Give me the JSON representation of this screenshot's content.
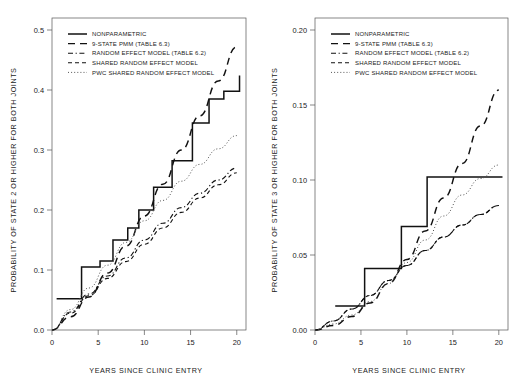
{
  "figure": {
    "background": "#ffffff",
    "ink_color": "#111111",
    "panel_count": 2
  },
  "chart_data": [
    {
      "type": "line",
      "panel": "left",
      "title": "",
      "xlabel": "YEARS SINCE CLINIC ENTRY",
      "ylabel": "PROBABILITY OF STATE 2 OR HIGHER FOR BOTH JOINTS",
      "xlim": [
        0,
        21
      ],
      "ylim": [
        0.0,
        0.52
      ],
      "xticks": [
        0,
        5,
        10,
        15,
        20
      ],
      "xticklabels": [
        "0",
        "5",
        "10",
        "15",
        "20"
      ],
      "yticks": [
        0.0,
        0.1,
        0.2,
        0.3,
        0.4,
        0.5
      ],
      "yticklabels": [
        "0.0",
        "0.1",
        "0.2",
        "0.3",
        "0.4",
        "0.5"
      ],
      "grid": false,
      "legend_position": "top-left",
      "series": [
        {
          "name": "NONPARAMETRIC",
          "style": "solid-step",
          "step_x": [
            0.5,
            2.0,
            3.2,
            5.2,
            6.6,
            8.2,
            9.4,
            11.0,
            13.0,
            15.2,
            17.0,
            18.6,
            20.3
          ],
          "step_y": [
            0.052,
            0.052,
            0.105,
            0.115,
            0.15,
            0.17,
            0.2,
            0.238,
            0.282,
            0.345,
            0.385,
            0.398,
            0.424
          ]
        },
        {
          "name": "9-STATE PMM (TABLE 6.3)",
          "style": "long-dash",
          "x": [
            0,
            2,
            4,
            6,
            8,
            10,
            12,
            14,
            16,
            18,
            20
          ],
          "y": [
            0.0,
            0.022,
            0.055,
            0.095,
            0.14,
            0.19,
            0.243,
            0.3,
            0.357,
            0.415,
            0.472
          ]
        },
        {
          "name": "RANDOM EFFECT MODEL (TABLE 6.2)",
          "style": "dash-dot",
          "x": [
            0,
            2,
            4,
            6,
            8,
            10,
            12,
            14,
            16,
            18,
            20
          ],
          "y": [
            0.0,
            0.03,
            0.06,
            0.09,
            0.12,
            0.15,
            0.178,
            0.204,
            0.228,
            0.25,
            0.27
          ]
        },
        {
          "name": "SHARED RANDOM EFFECT MODEL",
          "style": "dash",
          "x": [
            0,
            2,
            4,
            6,
            8,
            10,
            12,
            14,
            16,
            18,
            20
          ],
          "y": [
            0.0,
            0.028,
            0.057,
            0.086,
            0.114,
            0.143,
            0.17,
            0.196,
            0.22,
            0.242,
            0.262
          ]
        },
        {
          "name": "PWC SHARED RANDOM EFFECT MODEL",
          "style": "dotted",
          "x": [
            0,
            2,
            4,
            6,
            8,
            10,
            12,
            14,
            16,
            18,
            20
          ],
          "y": [
            0.0,
            0.034,
            0.07,
            0.108,
            0.146,
            0.182,
            0.216,
            0.248,
            0.276,
            0.302,
            0.324
          ]
        }
      ]
    },
    {
      "type": "line",
      "panel": "right",
      "title": "",
      "xlabel": "YEARS SINCE CLINIC ENTRY",
      "ylabel": "PROBABILITY OF STATE 3 OR HIGHER FOR BOTH JOINTS",
      "xlim": [
        0,
        21
      ],
      "ylim": [
        0.0,
        0.208
      ],
      "xticks": [
        0,
        5,
        10,
        15,
        20
      ],
      "xticklabels": [
        "0",
        "5",
        "10",
        "15",
        "20"
      ],
      "yticks": [
        0.0,
        0.05,
        0.1,
        0.15,
        0.2
      ],
      "yticklabels": [
        "0.00",
        "0.05",
        "0.10",
        "0.15",
        "0.20"
      ],
      "grid": false,
      "legend_position": "top-left",
      "series": [
        {
          "name": "NONPARAMETRIC",
          "style": "solid-step",
          "step_x": [
            2.2,
            5.4,
            5.4,
            9.4,
            9.4,
            12.2,
            12.2,
            20.4
          ],
          "step_y": [
            0.016,
            0.016,
            0.041,
            0.041,
            0.069,
            0.069,
            0.102,
            0.102
          ]
        },
        {
          "name": "9-STATE PMM (TABLE 6.3)",
          "style": "long-dash",
          "x": [
            0,
            2,
            4,
            6,
            8,
            10,
            12,
            14,
            16,
            18,
            20
          ],
          "y": [
            0.0,
            0.003,
            0.009,
            0.018,
            0.031,
            0.047,
            0.066,
            0.088,
            0.111,
            0.136,
            0.16
          ]
        },
        {
          "name": "RANDOM EFFECT MODEL (TABLE 6.2)",
          "style": "dash-dot",
          "x": [
            0,
            2,
            4,
            6,
            8,
            10,
            12,
            14,
            16,
            18,
            20
          ],
          "y": [
            0.0,
            0.006,
            0.014,
            0.023,
            0.033,
            0.043,
            0.053,
            0.062,
            0.07,
            0.077,
            0.083
          ]
        },
        {
          "name": "SHARED RANDOM EFFECT MODEL",
          "style": "dash",
          "x": [
            0,
            2,
            4,
            6,
            8,
            10,
            12,
            14,
            16,
            18,
            20
          ],
          "y": [
            0.0,
            0.006,
            0.014,
            0.023,
            0.033,
            0.043,
            0.053,
            0.062,
            0.07,
            0.077,
            0.083
          ]
        },
        {
          "name": "PWC SHARED RANDOM EFFECT MODEL",
          "style": "dotted",
          "x": [
            0,
            2,
            4,
            6,
            8,
            10,
            12,
            14,
            16,
            18,
            20
          ],
          "y": [
            0.0,
            0.004,
            0.01,
            0.019,
            0.031,
            0.045,
            0.06,
            0.076,
            0.09,
            0.101,
            0.11
          ]
        }
      ]
    }
  ],
  "legend": {
    "items": [
      {
        "label": "NONPARAMETRIC",
        "style": "solid"
      },
      {
        "label": "9-STATE PMM (TABLE 6.3)",
        "style": "long-dash"
      },
      {
        "label": "RANDOM EFFECT MODEL (TABLE 6.2)",
        "style": "dash-dot"
      },
      {
        "label": "SHARED RANDOM EFFECT MODEL",
        "style": "dash"
      },
      {
        "label": "PWC SHARED RANDOM EFFECT MODEL",
        "style": "dotted"
      }
    ]
  }
}
